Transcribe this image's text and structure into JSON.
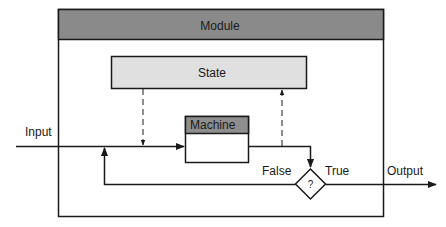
{
  "diagram": {
    "module": {
      "title": "Module",
      "header_color": "#8a8a8a",
      "border_color": "#1a1a1a"
    },
    "state": {
      "label": "State",
      "fill_color": "#e0e0e0"
    },
    "machine": {
      "label": "Machine",
      "header_color": "#8e8e8e"
    },
    "decision": {
      "symbol": "?"
    },
    "labels": {
      "input": "Input",
      "output": "Output",
      "false_branch": "False",
      "true_branch": "True"
    },
    "edges": [
      {
        "from": "Input",
        "to": "Machine",
        "style": "solid"
      },
      {
        "from": "State",
        "to": "Input line",
        "style": "dashed"
      },
      {
        "from": "Machine output line",
        "to": "State",
        "style": "dashed"
      },
      {
        "from": "Machine",
        "to": "Decision",
        "style": "solid"
      },
      {
        "from": "Decision",
        "to": "Input line",
        "label": "False",
        "style": "solid"
      },
      {
        "from": "Decision",
        "to": "Output",
        "label": "True",
        "style": "solid"
      }
    ]
  }
}
